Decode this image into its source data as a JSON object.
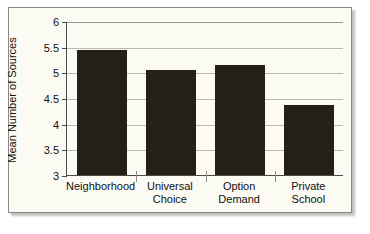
{
  "chart_data": {
    "type": "bar",
    "title": "",
    "xlabel": "",
    "ylabel": "Mean Number of Sources",
    "categories": [
      "Neighborhood",
      "Universal Choice",
      "Option Demand",
      "Private School"
    ],
    "category_lines": [
      [
        "Neighborhood"
      ],
      [
        "Universal",
        "Choice"
      ],
      [
        "Option",
        "Demand"
      ],
      [
        "Private School"
      ]
    ],
    "values": [
      5.44,
      5.05,
      5.14,
      4.37
    ],
    "ylim": [
      3,
      6
    ],
    "yticks": [
      3,
      3.5,
      4,
      4.5,
      5,
      5.5,
      6
    ],
    "ytick_labels": [
      "3",
      "3.5",
      "4",
      "4.5",
      "5",
      "5.5",
      "6"
    ],
    "grid": true,
    "legend": false,
    "bar_color": "#241f17",
    "plot_background": "#fbfaf3",
    "grid_color": "#b9b9b2",
    "axis_color": "#4a4a46"
  }
}
